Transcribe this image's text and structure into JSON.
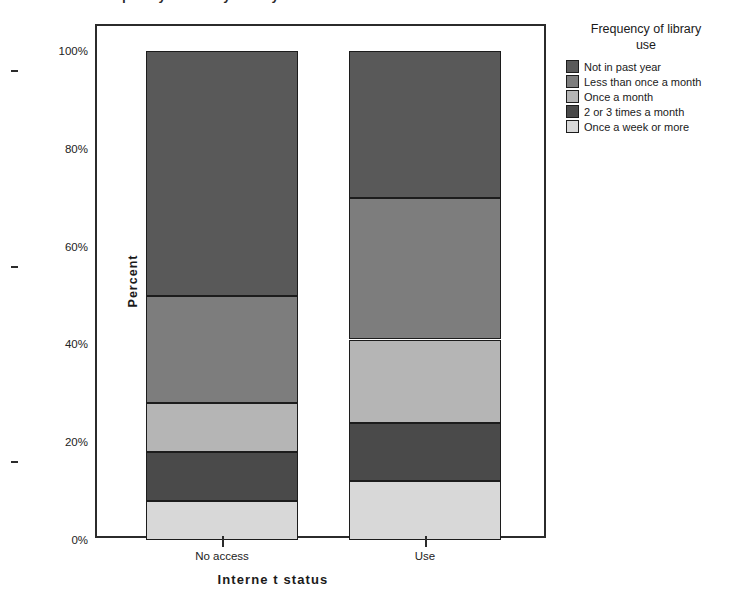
{
  "title_cropped": "Frequency of library use by Internet status",
  "axis": {
    "ylabel": "Percent",
    "xlabel": "Interne t status",
    "yticks": [
      "0%",
      "20%",
      "40%",
      "60%",
      "80%",
      "100%"
    ],
    "ytick_values": [
      0,
      20,
      40,
      60,
      80,
      100
    ],
    "xticks": [
      "No access",
      "Use"
    ]
  },
  "legend": {
    "title_line1": "Frequency of library",
    "title_line2": "use",
    "items": [
      {
        "label": "Not in past year",
        "color": "#595959"
      },
      {
        "label": "Less than once a month",
        "color": "#7d7d7d"
      },
      {
        "label": "Once a month",
        "color": "#b5b5b5"
      },
      {
        "label": "2 or 3 times a month",
        "color": "#4a4a4a"
      },
      {
        "label": "Once a week or more",
        "color": "#d8d8d8"
      }
    ]
  },
  "chart_data": {
    "type": "bar",
    "subtype": "stacked-100-percent",
    "title": "Frequency of library use by Internet status",
    "xlabel": "Interne t status",
    "ylabel": "Percent",
    "ylim": [
      0,
      100
    ],
    "grid": false,
    "legend_position": "right",
    "legend_title": "Frequency of library use",
    "categories": [
      "No access",
      "Use"
    ],
    "series": [
      {
        "name": "Once a week or more",
        "color": "#d8d8d8",
        "values": [
          8,
          12
        ]
      },
      {
        "name": "2 or 3 times a month",
        "color": "#4a4a4a",
        "values": [
          10,
          12
        ]
      },
      {
        "name": "Once a month",
        "color": "#b5b5b5",
        "values": [
          10,
          17
        ]
      },
      {
        "name": "Less than once a month",
        "color": "#7d7d7d",
        "values": [
          22,
          29
        ]
      },
      {
        "name": "Not in past year",
        "color": "#595959",
        "values": [
          50,
          30
        ]
      }
    ],
    "cumulative_boundaries": {
      "No access": [
        0,
        8,
        18,
        28,
        50,
        100
      ],
      "Use": [
        0,
        12,
        24,
        41,
        70,
        100
      ]
    }
  }
}
